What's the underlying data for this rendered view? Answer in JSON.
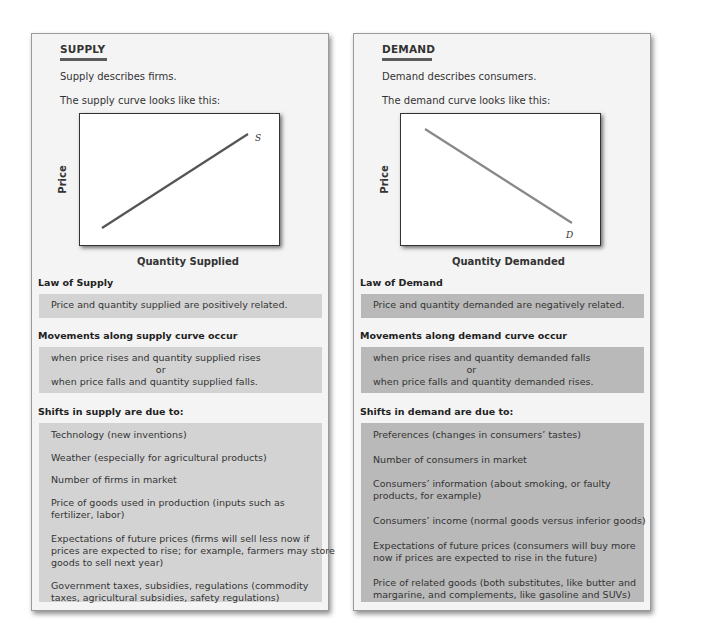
{
  "supply": {
    "title": "SUPPLY",
    "describes": "Supply describes firms.",
    "curve_intro": "The supply curve looks like this:",
    "chart": {
      "ylabel": "Price",
      "xlabel": "Quantity Supplied",
      "curve_label": "S"
    },
    "law_heading": "Law of Supply",
    "law_text": "Price and quantity supplied are positively related.",
    "movements_heading": "Movements along supply curve occur",
    "movements": [
      "when price rises and quantity supplied rises",
      "or",
      "when price falls and quantity supplied falls."
    ],
    "shifts_heading": "Shifts in supply are due to:",
    "shifts": [
      "Technology (new inventions)",
      "Weather (especially for agricultural products)",
      "Number of firms in market",
      "Price of goods used in production (inputs such as",
      "fertilizer, labor)",
      "Expectations of future prices (firms will sell less now if",
      "prices are expected to rise; for example, farmers may store",
      "goods to sell next year)",
      "Government taxes, subsidies, regulations (commodity",
      "taxes, agricultural subsidies, safety regulations)"
    ]
  },
  "demand": {
    "title": "DEMAND",
    "describes": "Demand describes consumers.",
    "curve_intro": "The demand curve looks like this:",
    "chart": {
      "ylabel": "Price",
      "xlabel": "Quantity Demanded",
      "curve_label": "D"
    },
    "law_heading": "Law of Demand",
    "law_text": "Price and quantity demanded are negatively related.",
    "movements_heading": "Movements along demand curve occur",
    "movements": [
      "when price rises and quantity demanded falls",
      "or",
      "when price falls and quantity demanded rises."
    ],
    "shifts_heading": "Shifts in demand are due to:",
    "shifts": [
      "Preferences (changes in consumers’ tastes)",
      "Number of consumers in market",
      "Consumers’ information (about smoking, or faulty",
      "products, for example)",
      "Consumers’ income (normal goods versus inferior goods)",
      "Expectations of future prices (consumers will buy more",
      "now if prices are expected to rise in the future)",
      "Price of related goods (both substitutes, like butter and",
      "margarine, and complements, like gasoline and SUVs)"
    ]
  },
  "colors": {
    "supply_box": "#d3d3d3",
    "demand_box": "#b9b9b9",
    "panel_bg": "#f4f4f4",
    "supply_curve": "#555555",
    "demand_curve": "#888888"
  }
}
